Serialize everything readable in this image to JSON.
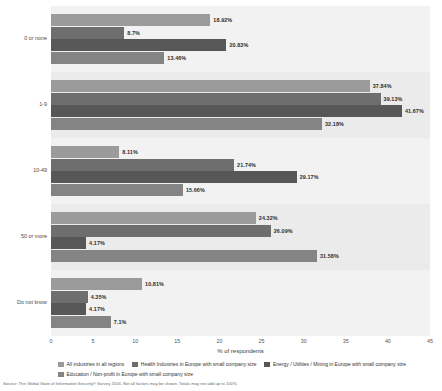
{
  "chart_data": {
    "type": "bar",
    "orientation": "horizontal",
    "title": "",
    "xlabel": "% of respondents",
    "ylabel": "",
    "xlim": [
      0,
      45
    ],
    "xticks": [
      0,
      5,
      10,
      15,
      20,
      25,
      30,
      35,
      40,
      45
    ],
    "grid": true,
    "legend_position": "bottom",
    "categories": [
      "0 or none",
      "1-9",
      "10-49",
      "50 or more",
      "Do not know"
    ],
    "series": [
      {
        "name": "All industries in all regions",
        "color": "#9b9b9b",
        "values": [
          18.92,
          37.84,
          8.11,
          24.32,
          10.81
        ],
        "labels": [
          "18.92%",
          "37.84%",
          "8.11%",
          "24.32%",
          "10.81%"
        ]
      },
      {
        "name": "Health Industries in Europe with small company size",
        "color": "#6e6e6e",
        "values": [
          8.7,
          39.13,
          21.74,
          26.09,
          4.35
        ],
        "labels": [
          "8.7%",
          "39.13%",
          "21.74%",
          "26.09%",
          "4.35%"
        ]
      },
      {
        "name": "Energy / Utilities / Mining in Europe with small company size",
        "color": "#575757",
        "values": [
          20.83,
          41.67,
          29.17,
          4.17,
          4.17
        ],
        "labels": [
          "20.83%",
          "41.67%",
          "29.17%",
          "4.17%",
          "4.17%"
        ]
      },
      {
        "name": "Education / Non-profit in Europe with small company size",
        "color": "#848484",
        "values": [
          13.46,
          32.18,
          15.66,
          31.58,
          7.1
        ],
        "labels": [
          "13.46%",
          "32.18%",
          "15.66%",
          "31.58%",
          "7.1%"
        ]
      }
    ]
  },
  "axis": {
    "x_title": "% of respondents"
  },
  "source": {
    "text": "Source: The Global State of Information Security® Survey 2016. Not all factors may be shown. Totals may not add up to 100%."
  }
}
